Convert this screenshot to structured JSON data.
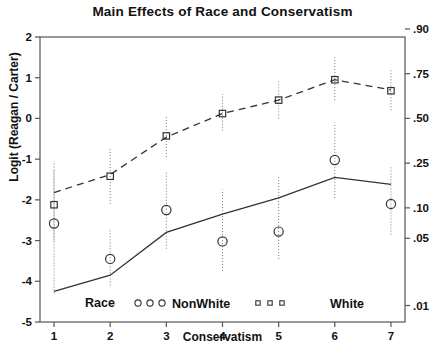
{
  "chart_data": {
    "type": "line",
    "title": "Main Effects of Race and Conservatism",
    "xlabel": "Conservatism",
    "ylabel": "Logit (Reagan / Carter)",
    "x": [
      1,
      2,
      3,
      4,
      5,
      6,
      7
    ],
    "xlim": [
      0.75,
      7.25
    ],
    "ylim": [
      -5,
      2
    ],
    "grid": false,
    "legend_position": "inside-bottom",
    "legend_title": "Race",
    "y_ticks": [
      2,
      1,
      0,
      -1,
      -2,
      -3,
      -4,
      -5
    ],
    "y_tick_labels": [
      "2",
      "1",
      "0",
      "-1",
      "-2",
      "-3",
      "-4",
      "-5"
    ],
    "y2_label": "",
    "y2_ticks": [
      2.197,
      1.099,
      0.0,
      -1.099,
      -2.197,
      -2.944,
      -4.595
    ],
    "y2_tick_labels": [
      ".90",
      ".75",
      ".50",
      ".25",
      ".10",
      ".05",
      ".01"
    ],
    "series": [
      {
        "name": "White",
        "marker": "square",
        "linestyle": "dashed",
        "fitted": [
          -1.82,
          -1.38,
          -0.46,
          0.12,
          0.45,
          0.95,
          0.7
        ],
        "observed": [
          -2.12,
          -1.42,
          -0.43,
          0.12,
          0.45,
          0.95,
          0.68
        ],
        "err_low": [
          -3.0,
          -2.1,
          -0.95,
          -0.3,
          0.0,
          0.45,
          0.2
        ],
        "err_high": [
          -1.25,
          -0.75,
          0.05,
          0.6,
          0.95,
          1.5,
          1.22
        ]
      },
      {
        "name": "NonWhite",
        "marker": "circle",
        "linestyle": "solid",
        "fitted": [
          -4.25,
          -3.85,
          -2.8,
          -2.35,
          -1.95,
          -1.45,
          -1.62
        ],
        "observed": [
          -2.58,
          -3.45,
          -2.25,
          -3.02,
          -2.78,
          -1.02,
          -2.1
        ],
        "err_low": [
          -4.3,
          -4.1,
          -3.2,
          -3.75,
          -3.45,
          -1.95,
          -2.85
        ],
        "err_high": [
          -1.05,
          -2.7,
          -1.3,
          -1.75,
          -1.42,
          -0.1,
          -1.2
        ]
      }
    ],
    "legend_entries": [
      {
        "label": "NonWhite",
        "marker": "circle"
      },
      {
        "label": "White",
        "marker": "square"
      }
    ]
  }
}
